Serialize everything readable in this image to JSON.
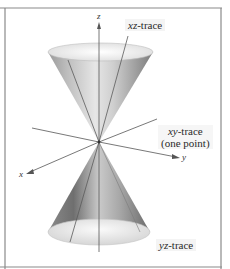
{
  "figure": {
    "axes": {
      "x_label": "x",
      "y_label": "y",
      "z_label": "z"
    },
    "labels": {
      "xz_trace_var": "xz",
      "xz_trace_suffix": "-trace",
      "xy_trace_var": "xy",
      "xy_trace_suffix": "-trace",
      "xy_trace_note": "(one point)",
      "yz_trace_var": "yz",
      "yz_trace_suffix": "-trace"
    },
    "colors": {
      "frame": "#7a7a7a",
      "axis": "#555555",
      "cone_dark": "#6e6e6e",
      "cone_light": "#e8e8e8",
      "label_bg": "#f4f4f4"
    }
  }
}
